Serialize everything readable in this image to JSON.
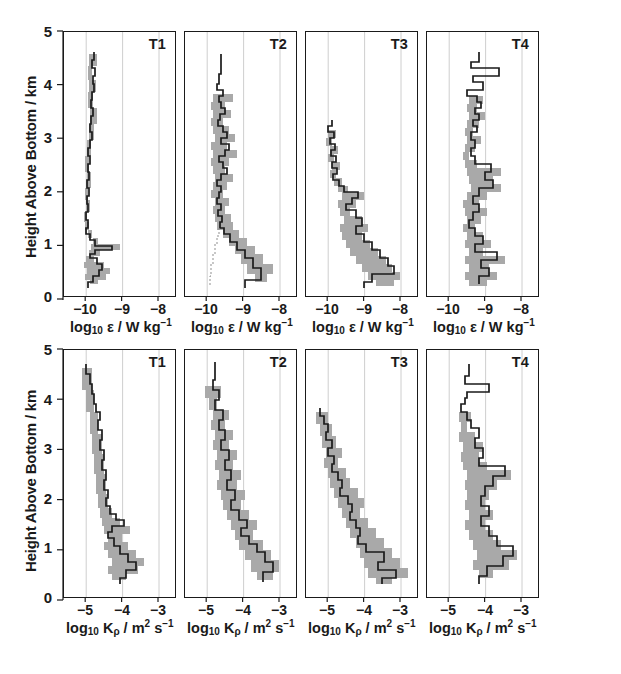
{
  "figure": {
    "axis": {
      "y_label": "Height Above Bottom / km",
      "y_ticks": [
        "5",
        "4",
        "3",
        "2",
        "1",
        "0"
      ],
      "y_values": [
        5,
        4,
        3,
        2,
        1,
        0
      ],
      "y_range": [
        0,
        5
      ],
      "eps_x_ticks": [
        "−10",
        "−9",
        "−8"
      ],
      "eps_x_values": [
        -10,
        -9,
        -8
      ],
      "eps_x_range": [
        -10.6,
        -7.55
      ],
      "eps_x_label_html": "log<sub>10</sub> ε / W kg<sup>−1</sup>",
      "kappa_x_ticks": [
        "−5",
        "−4",
        "−3"
      ],
      "kappa_x_values": [
        -5,
        -4,
        -3
      ],
      "kappa_x_range": [
        -5.62,
        -2.55
      ],
      "kappa_x_label_html": "log<sub>10</sub> K<sub>ρ</sub> / m<sup>2</sup> s<sup>−1</sup>"
    },
    "panel_titles": [
      "T1",
      "T2",
      "T3",
      "T4"
    ],
    "colors": {
      "line": "#1a1a1a",
      "band": "#a9a9a9",
      "gridline": "#c8c8c8",
      "frame": "#1a1a1a",
      "background": "#ffffff"
    }
  },
  "chart_data": [
    {
      "type": "line",
      "id": "eps-T1",
      "title": "T1",
      "xlabel": "log10 eps / W kg^-1",
      "ylabel": "Height Above Bottom / km",
      "xlim": [
        -10.6,
        -7.55
      ],
      "ylim": [
        0,
        5
      ],
      "grid": true,
      "x": [
        -9.83,
        -9.78,
        -9.76,
        -9.72,
        -9.64,
        -9.68,
        -9.72,
        -9.7,
        -9.66,
        -9.73,
        -9.8,
        -9.74,
        -9.72,
        -9.68,
        -9.66,
        -9.62,
        -9.62,
        -9.65,
        -9.7,
        -9.73,
        -9.76,
        -9.78,
        -9.74,
        -9.7,
        -9.73,
        -9.78,
        -9.8,
        -9.78,
        -9.76,
        -9.79,
        -9.82,
        -9.8,
        -9.77,
        -9.78,
        -9.82,
        -9.84,
        -9.82,
        -9.78,
        -9.76,
        -9.8,
        -9.84,
        -9.86,
        -9.84,
        -9.8,
        -9.82,
        -9.86,
        -9.88,
        -9.86,
        -9.84,
        -9.86,
        -9.9,
        -9.88,
        -9.85,
        -9.86,
        -9.9,
        -9.92,
        -9.9,
        -9.86,
        -9.84,
        -9.88,
        -9.92,
        -9.95,
        -9.93,
        -9.9,
        -9.92,
        -9.95,
        -9.97,
        -9.94,
        -9.9,
        -9.88,
        -9.92,
        -9.96,
        -9.98,
        -9.95,
        -9.9,
        -9.86,
        -9.9,
        -9.95,
        -9.98,
        -9.96,
        -9.92,
        -9.88,
        -9.86,
        -9.9,
        -9.94,
        -9.9,
        -9.86,
        -9.84,
        -9.88,
        -9.92,
        -9.9,
        -9.86,
        -9.82,
        -9.86,
        -9.9,
        -9.88,
        -9.84,
        -9.8,
        -9.82,
        -9.86,
        -9.82,
        -9.76,
        -9.7,
        -9.65,
        -9.62,
        -9.58,
        -9.54,
        -9.5,
        -9.52,
        -9.58,
        -9.64,
        -9.6,
        -9.52,
        -9.45,
        -9.48,
        -9.56,
        -9.62,
        -9.58,
        -9.5,
        -9.44,
        -9.4,
        -9.46,
        -9.55,
        -9.62,
        -9.7,
        -9.74,
        -9.66,
        -9.58,
        -9.52,
        -9.56,
        -9.62,
        -9.7,
        -9.75,
        -9.72,
        -9.66,
        -9.6,
        -9.56,
        -9.62,
        -9.7,
        -9.76,
        -9.74,
        -9.68,
        -9.62,
        -9.66,
        -9.74,
        -9.8,
        -9.78,
        -9.72
      ],
      "y": [
        4.58,
        4.54,
        4.5,
        4.46,
        4.42,
        4.38,
        4.34,
        4.3,
        4.26,
        4.22,
        4.18,
        4.14,
        4.1,
        4.06,
        4.02,
        3.98,
        3.94,
        3.9,
        3.86,
        3.82,
        3.78,
        3.74,
        3.7,
        3.66,
        3.62,
        3.58,
        3.54,
        3.5,
        3.46,
        3.42,
        3.38,
        3.34,
        3.3,
        3.26,
        3.22,
        3.18,
        3.14,
        3.1,
        3.06,
        3.02,
        2.98,
        2.94,
        2.9,
        2.86,
        2.82,
        2.78,
        2.74,
        2.7,
        2.66,
        2.62,
        2.58,
        2.54,
        2.5,
        2.46,
        2.42,
        2.38,
        2.34,
        2.3,
        2.26,
        2.22,
        2.18,
        2.14,
        2.1,
        2.06,
        2.02,
        1.98,
        1.94,
        1.9,
        1.86,
        1.82,
        1.78,
        1.74,
        1.7,
        1.66,
        1.62,
        1.58,
        1.54,
        1.5,
        1.46,
        1.42,
        1.38,
        1.34,
        1.3,
        1.26,
        1.22,
        1.18,
        1.14,
        1.1,
        1.06,
        1.02,
        0.98,
        0.94,
        0.9,
        0.86,
        0.82,
        0.78,
        0.74,
        0.7,
        0.66,
        0.62,
        0.58,
        0.54,
        0.5,
        0.46,
        0.42,
        0.38,
        0.34,
        0.3,
        0.26,
        0.24,
        0.22,
        0.2,
        0.18,
        0.16,
        0.14,
        0.12,
        0.1,
        0.09,
        0.08,
        0.07,
        0.06,
        0.05,
        0.04,
        0.03,
        0.02,
        0.015,
        0.012,
        0.01,
        0.009,
        0.008,
        0.007,
        0.006,
        0.005,
        0.004,
        0.003,
        0.002,
        0.0018,
        0.0015,
        0.0012,
        0.001,
        0.0008,
        0.0006,
        0.0005,
        0.0004,
        0.0003,
        0.0002,
        0.00015,
        0.0001,
        5e-05,
        2e-05,
        1e-05
      ]
    },
    {
      "type": "line",
      "id": "eps-T2",
      "title": "T2",
      "xlim": [
        -10.6,
        -7.55
      ],
      "ylim": [
        0,
        5
      ],
      "grid": true,
      "note": "Profile centred near -9.6 from 0.9-4.0 km, broadening to -8.7 below 0.6 km"
    },
    {
      "type": "line",
      "id": "eps-T3",
      "title": "T3",
      "xlim": [
        -10.6,
        -7.55
      ],
      "ylim": [
        0,
        5
      ],
      "grid": true,
      "note": "Profile near -9.9 above 2 km, increasing monotonically to -8.2 near 0.3 km"
    },
    {
      "type": "line",
      "id": "eps-T4",
      "title": "T4",
      "xlim": [
        -10.6,
        -7.55
      ],
      "ylim": [
        0,
        5
      ],
      "grid": true,
      "note": "Noisy unshaded excursions 3.6-4.3 km; shaded profile -9.4 to -8.6 below 3.5 km"
    },
    {
      "type": "line",
      "id": "kappa-T1",
      "title": "T1",
      "xlabel": "log10 K_rho / m^2 s^-1",
      "ylabel": "Height Above Bottom / km",
      "xlim": [
        -5.62,
        -2.55
      ],
      "ylim": [
        0,
        5
      ],
      "grid": true,
      "note": "Decreasing from -5.1 at 4.6 km to -4.2 near 1 km, -3.9 at 0.4 km"
    },
    {
      "type": "line",
      "id": "kappa-T2",
      "title": "T2",
      "xlim": [
        -5.62,
        -2.55
      ],
      "ylim": [
        0,
        5
      ],
      "grid": true,
      "note": "About -4.9 from 2.5-4 km, increasing to -3.2 near 0.35 km"
    },
    {
      "type": "line",
      "id": "kappa-T3",
      "title": "T3",
      "xlim": [
        -5.62,
        -2.55
      ],
      "ylim": [
        0,
        5
      ],
      "grid": true,
      "note": "From -5.3 at 3.5 km steadily to -2.9 at 0.35 km"
    },
    {
      "type": "line",
      "id": "kappa-T4",
      "title": "T4",
      "xlim": [
        -5.62,
        -2.55
      ],
      "ylim": [
        0,
        5
      ],
      "grid": true,
      "note": "Unshaded spikes 3.5-4.4 km; shaded band -4.6 to -3.2 below 3.4 km"
    }
  ]
}
